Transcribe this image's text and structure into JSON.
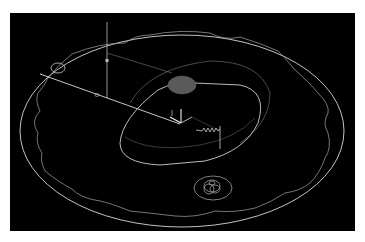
{
  "viewport": {
    "background": "#000000",
    "line_color": "#d8d8d8",
    "dim_line_color": "#9a9a9a",
    "fill_gray": "#5a5a5a",
    "objects": [
      {
        "name": "outer-ellipse",
        "type": "ellipse"
      },
      {
        "name": "scalloped-gear-profile",
        "type": "path"
      },
      {
        "name": "center-slot",
        "type": "obround"
      },
      {
        "name": "gray-disc",
        "type": "filled-ellipse"
      },
      {
        "name": "ucs-axis-gizmo",
        "type": "icon"
      },
      {
        "name": "spring-symbol",
        "type": "zigzag"
      },
      {
        "name": "vertical-guide-line",
        "type": "line"
      },
      {
        "name": "diagonal-radius-line",
        "type": "line"
      },
      {
        "name": "small-circle-left",
        "type": "ellipse"
      },
      {
        "name": "concentric-circles-bottom",
        "type": "ellipse-group"
      }
    ]
  }
}
